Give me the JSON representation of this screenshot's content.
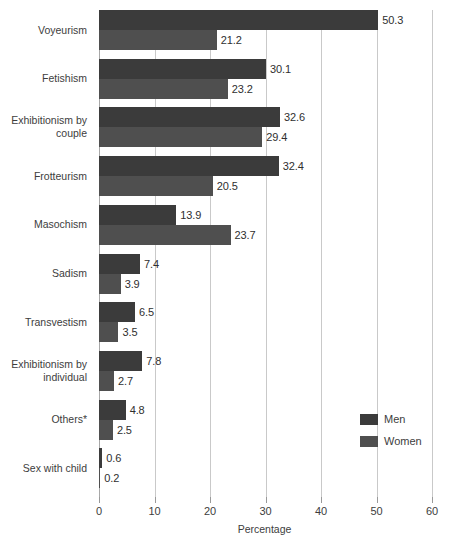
{
  "chart_data": {
    "type": "bar",
    "orientation": "horizontal",
    "title": "",
    "xlabel": "Percentage",
    "ylabel": "",
    "xlim": [
      0,
      60
    ],
    "xticks": [
      0,
      10,
      20,
      30,
      40,
      50,
      60
    ],
    "xtick_labels": [
      "0",
      "10",
      "20",
      "30",
      "40",
      "50",
      "60"
    ],
    "grid": true,
    "legend_position": "right-lower",
    "categories": [
      "Voyeurism",
      "Fetishism",
      "Exhibitionism by couple",
      "Frotteurism",
      "Masochism",
      "Sadism",
      "Transvestism",
      "Exhibitionism by individual",
      "Others*",
      "Sex with child"
    ],
    "series": [
      {
        "name": "Men",
        "color": "#3b3b3b",
        "values": [
          50.3,
          30.1,
          32.6,
          32.4,
          13.9,
          7.4,
          6.5,
          7.8,
          4.8,
          0.6
        ]
      },
      {
        "name": "Women",
        "color": "#4f4f4f",
        "values": [
          21.2,
          23.2,
          29.4,
          20.5,
          23.7,
          3.9,
          3.5,
          2.7,
          2.5,
          0.2
        ]
      }
    ]
  },
  "legend": {
    "items": [
      {
        "label": "Men"
      },
      {
        "label": "Women"
      }
    ]
  },
  "axis": {
    "x_title": "Percentage"
  },
  "colors": {
    "men": "#3b3b3b",
    "women": "#4f4f4f",
    "gridline": "#c9c9c9",
    "text": "#3d3d3d",
    "background": "#ffffff"
  }
}
